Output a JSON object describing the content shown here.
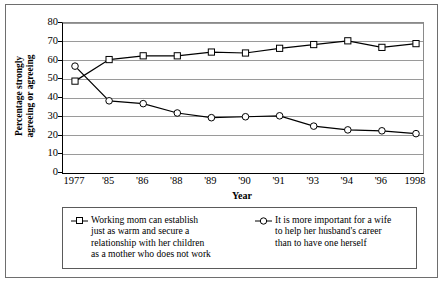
{
  "chart_data": {
    "type": "line",
    "title": "",
    "xlabel": "Year",
    "ylabel": "Percentage strongly agreeing or agreeing",
    "ylabel_lines": [
      "Percentage strongly",
      "agreeing or agreeing"
    ],
    "categories": [
      "1977",
      "'85",
      "'86",
      "'88",
      "'89",
      "'90",
      "'91",
      "'93",
      "'94",
      "'96",
      "1998"
    ],
    "ylim": [
      0,
      80
    ],
    "ytick_values": [
      0,
      10,
      20,
      30,
      40,
      50,
      60,
      70,
      80
    ],
    "ytick_labels": [
      "0",
      "10",
      "20",
      "30",
      "40",
      "50",
      "60",
      "70",
      "80"
    ],
    "grid": true,
    "grid_axis": "y",
    "legend_position": "below-plot",
    "series": [
      {
        "name": "Working mom can establish just as warm and secure a relationship with her children as a mother who does not work",
        "name_lines": [
          "Working mom can establish",
          "just as warm and secure a",
          "relationship with her children",
          "as a mother who does not work"
        ],
        "marker": "square",
        "color": "#000000",
        "values": [
          49,
          60.5,
          62.5,
          62.5,
          64.5,
          64,
          66.5,
          68.5,
          70.5,
          67,
          69
        ]
      },
      {
        "name": "It is more important for a wife to help her husband's career than to have one herself",
        "name_lines": [
          "It is more important for a wife",
          "to help her husband's career",
          "than to have one herself"
        ],
        "marker": "circle",
        "color": "#000000",
        "values": [
          57,
          38.5,
          37,
          32,
          29.5,
          30,
          30.5,
          25,
          23,
          22.5,
          21
        ]
      }
    ]
  },
  "style": {
    "axis_color": "#000000",
    "grid_color": "#9a9a9a",
    "frame_color": "#6e6e6e",
    "background": "#ffffff",
    "line_color": "#000000"
  }
}
